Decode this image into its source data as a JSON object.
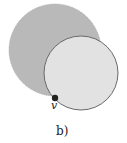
{
  "diagram": {
    "large_circle": {
      "cx": 55,
      "cy": 50,
      "r": 46,
      "fill": "#b9b9b9"
    },
    "small_circle": {
      "cx": 81,
      "cy": 73,
      "r": 37,
      "fill": "#e2e2e2",
      "stroke": "#6a6a6a"
    },
    "vertex": {
      "cx": 55,
      "cy": 98,
      "r": 3.2,
      "fill": "#222222",
      "label": "v"
    },
    "caption": "b)"
  }
}
